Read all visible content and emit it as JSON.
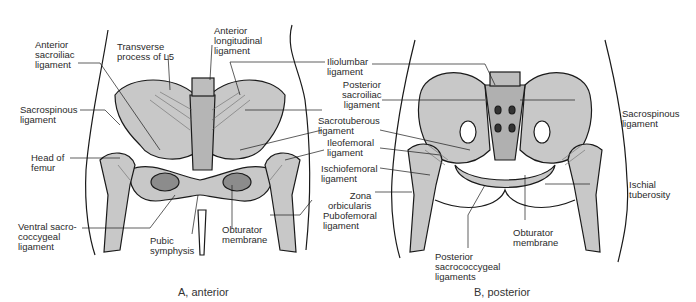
{
  "figure": {
    "panels": [
      {
        "id": "anterior",
        "caption": "A, anterior",
        "labels": {
          "anterior_sacroiliac": "Anterior\nsacroiliac\nligament",
          "transverse_process": "Transverse\nprocess of L5",
          "anterior_longitudinal": "Anterior\nlongitudinal\nligament",
          "sacrospinous": "Sacrospinous\nligament",
          "head_of_femur": "Head of\nfemur",
          "ventral_sacrococcygeal": "Ventral sacro-\ncoccygeal\nligament",
          "pubic_symphysis": "Pubic\nsymphysis",
          "obturator_membrane": "Obturator\nmembrane"
        }
      },
      {
        "id": "posterior",
        "caption": "B, posterior",
        "labels": {
          "posterior_sacrococcygeal": "Posterior\nsacrococcygeal\nligaments",
          "obturator_membrane": "Obturator\nmembrane",
          "sacrospinous": "Sacrospinous\nligament",
          "ischial_tuberosity": "Ischial\ntuberosity"
        }
      }
    ],
    "shared_labels": {
      "iliolumbar": "Iliolumbar\nligament",
      "posterior_sacroiliac": "Posterior\nsacroiliac\nligament",
      "sacrotuberous": "Sacrotuberous\nligament",
      "ileofemoral": "Ileofemoral\nligament",
      "ischiofemoral": "Ischiofemoral\nligament",
      "zona_orbicularis": "Zona\norbicularis",
      "pubofemoral": "Pubofemoral\nligament"
    },
    "colors": {
      "bone": "#c8c8c8",
      "outline": "#1a1a1a",
      "ligament": "#6a6a6a"
    }
  }
}
